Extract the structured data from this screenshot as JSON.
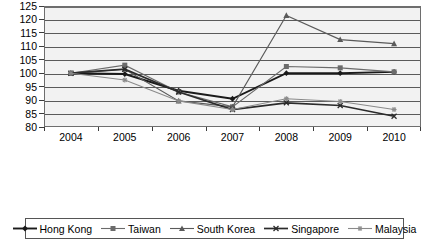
{
  "chart_data": {
    "type": "line",
    "title": "",
    "subtitle": "",
    "xlabel": "",
    "ylabel": "",
    "categories": [
      "2004",
      "2005",
      "2006",
      "2007",
      "2008",
      "2009",
      "2010"
    ],
    "ylim": [
      80,
      125
    ],
    "yticks": [
      80,
      85,
      90,
      95,
      100,
      105,
      110,
      115,
      120,
      125
    ],
    "grid": true,
    "legend_position": "bottom",
    "plot_background": "#f2f2f2",
    "series": [
      {
        "name": "Hong Kong",
        "marker": "diamond",
        "color": "#1a1a1a",
        "line_width": 1.9,
        "values": [
          100.0,
          99.7,
          93.5,
          90.5,
          100.0,
          100.0,
          100.5
        ]
      },
      {
        "name": "Taiwan",
        "marker": "square",
        "color": "#6b6b6b",
        "line_width": 1.1,
        "values": [
          100.0,
          103.0,
          93.0,
          87.5,
          102.5,
          102.0,
          100.5
        ]
      },
      {
        "name": "South Korea",
        "marker": "triangle",
        "color": "#5a5a5a",
        "line_width": 1.1,
        "values": [
          100.0,
          101.5,
          89.7,
          87.5,
          121.5,
          112.5,
          111.0
        ]
      },
      {
        "name": "Singapore",
        "marker": "x",
        "color": "#2b2b2b",
        "line_width": 1.7,
        "values": [
          100.0,
          101.5,
          93.0,
          86.5,
          89.0,
          88.0,
          84.0
        ]
      },
      {
        "name": "Malaysia",
        "marker": "star",
        "color": "#8a8a8a",
        "line_width": 1.1,
        "values": [
          100.0,
          97.5,
          89.7,
          86.5,
          90.5,
          89.5,
          86.5
        ]
      }
    ]
  }
}
